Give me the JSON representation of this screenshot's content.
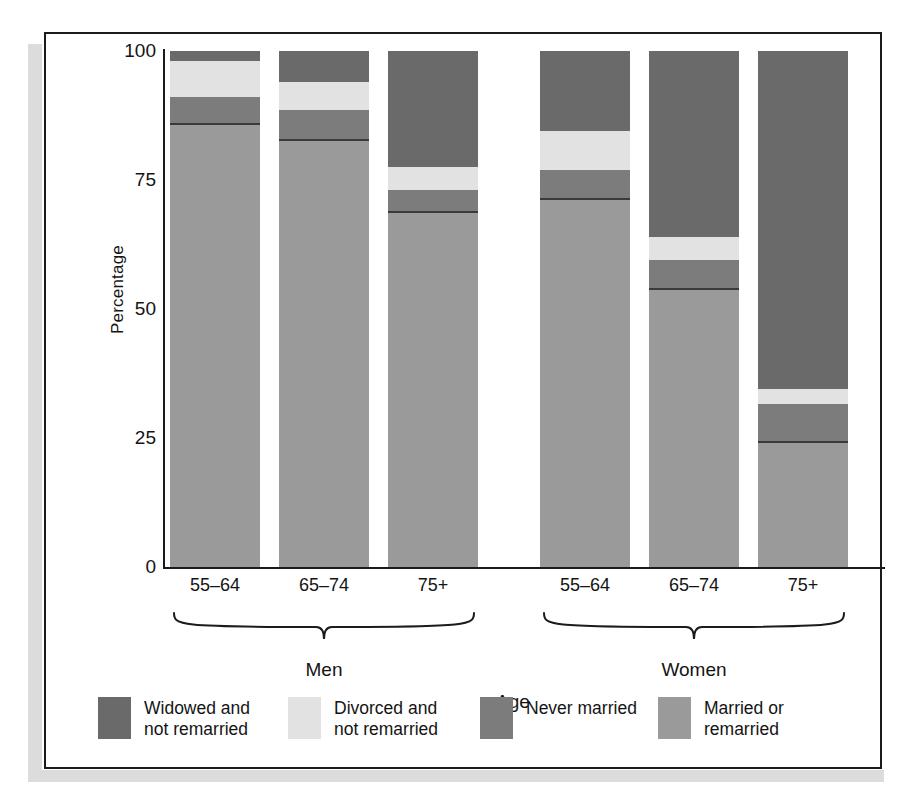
{
  "chart_data": {
    "type": "bar",
    "subtype": "stacked-bar-100",
    "title": "",
    "xlabel": "Age",
    "ylabel": "Percentage",
    "ylim": [
      0,
      100
    ],
    "yticks": [
      0,
      25,
      50,
      75,
      100
    ],
    "ytick_labels": [
      "0",
      "25",
      "50",
      "75",
      "100"
    ],
    "grid": false,
    "legend_position": "bottom",
    "groups": [
      "Men",
      "Women"
    ],
    "categories": [
      "55–64",
      "65–74",
      "75+",
      "55–64",
      "65–74",
      "75+"
    ],
    "series": [
      {
        "name": "Widowed and\nnot remarried",
        "color": "#6a6a6a",
        "values": [
          2.0,
          6.0,
          22.5,
          15.5,
          36.0,
          65.5
        ]
      },
      {
        "name": "Divorced and\nnot remarried",
        "color": "#e2e2e2",
        "values": [
          7.0,
          5.5,
          4.5,
          7.5,
          4.5,
          3.0
        ]
      },
      {
        "name": "Never married",
        "color": "#7c7c7c",
        "values": [
          5.0,
          5.5,
          4.0,
          5.5,
          5.5,
          7.0
        ]
      },
      {
        "name": "Married or\nremarried",
        "color": "#9a9a9a",
        "values": [
          86.0,
          83.0,
          69.0,
          71.5,
          54.0,
          24.5
        ]
      }
    ]
  },
  "axis": {
    "y_label": "Percentage",
    "x_label": "Age",
    "y_ticks": [
      "100",
      "75",
      "50",
      "25",
      "0"
    ]
  },
  "groups": [
    {
      "label": "Men"
    },
    {
      "label": "Women"
    }
  ],
  "bars": [
    {
      "category": "55–64",
      "group": "Men",
      "segments": [
        2.0,
        7.0,
        5.0,
        86.0
      ]
    },
    {
      "category": "65–74",
      "group": "Men",
      "segments": [
        6.0,
        5.5,
        5.5,
        83.0
      ]
    },
    {
      "category": "75+",
      "group": "Men",
      "segments": [
        22.5,
        4.5,
        4.0,
        69.0
      ]
    },
    {
      "category": "55–64",
      "group": "Women",
      "segments": [
        15.5,
        7.5,
        5.5,
        71.5
      ]
    },
    {
      "category": "65–74",
      "group": "Women",
      "segments": [
        36.0,
        4.5,
        5.5,
        54.0
      ]
    },
    {
      "category": "75+",
      "group": "Women",
      "segments": [
        65.5,
        3.0,
        7.0,
        24.5
      ]
    }
  ],
  "legend": {
    "items": [
      {
        "label": "Widowed and\nnot remarried",
        "color": "#6a6a6a"
      },
      {
        "label": "Divorced and\nnot remarried",
        "color": "#e2e2e2"
      },
      {
        "label": "Never married",
        "color": "#7c7c7c"
      },
      {
        "label": "Married or\nremarried",
        "color": "#9a9a9a"
      }
    ]
  },
  "colors": {
    "widowed": "#6a6a6a",
    "divorced": "#e2e2e2",
    "never_married": "#7c7c7c",
    "married": "#9a9a9a",
    "ink": "#1b1b1b",
    "frame": "#1b1b1b",
    "shadow": "#dcdcdc"
  }
}
